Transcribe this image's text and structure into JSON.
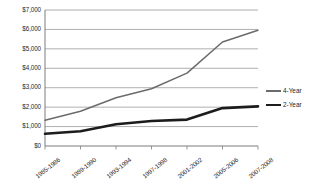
{
  "chart_data": {
    "type": "line",
    "title": "",
    "subtitle": "",
    "xlabel": "",
    "ylabel": "",
    "categories": [
      "1985-1986",
      "1989-1990",
      "1993-1994",
      "1997-1998",
      "2001-2002",
      "2005-2006",
      "2007-2008"
    ],
    "series": [
      {
        "name": "4-Year",
        "values": [
          1320,
          1790,
          2480,
          2950,
          3750,
          5350,
          5960
        ],
        "color": "#6b6b6b",
        "line_width": 1.5
      },
      {
        "name": "2-Year",
        "values": [
          630,
          760,
          1120,
          1290,
          1360,
          1950,
          2040
        ],
        "color": "#1c1c1c",
        "line_width": 2.6
      }
    ],
    "ylim": [
      0,
      7000
    ],
    "ytick_values": [
      0,
      1000,
      2000,
      3000,
      4000,
      5000,
      6000,
      7000
    ],
    "ytick_labels": [
      "$0",
      "$1,000",
      "$2,000",
      "$3,000",
      "$4,000",
      "$5,000",
      "$6,000",
      "$7,000"
    ],
    "grid": true,
    "grid_axis": "y",
    "grid_color": "#9a9a9a",
    "axis_color": "#7d7d7d",
    "legend_position": "right",
    "legend_entries": [
      "4-Year",
      "2-Year"
    ],
    "background": "#ffffff"
  }
}
